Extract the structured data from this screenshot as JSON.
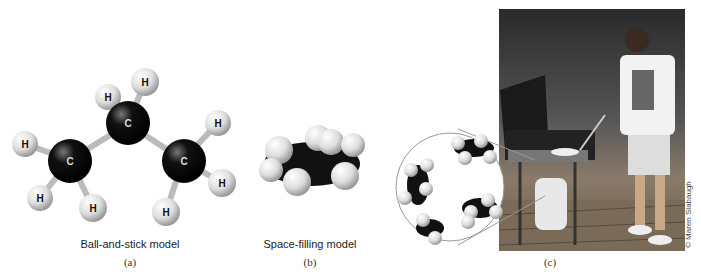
{
  "panels": [
    {
      "id": "a",
      "caption": "Ball-and-stick model",
      "label": "(a)",
      "atom_labels": {
        "carbon": "C",
        "hydrogen": "H"
      }
    },
    {
      "id": "b",
      "caption": "Space-filling model",
      "label": "(b)"
    },
    {
      "id": "c",
      "caption": "",
      "label": "(c)",
      "credit": "© Maren Slabaugh"
    }
  ]
}
